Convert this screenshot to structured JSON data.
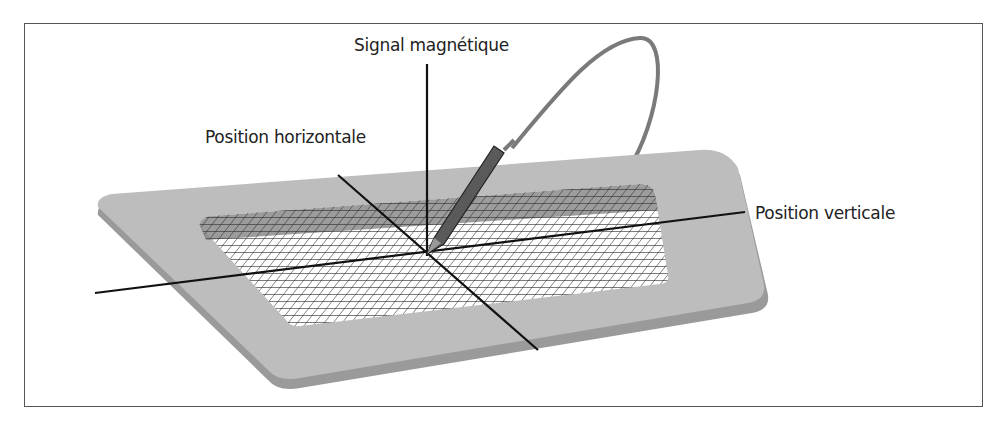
{
  "figure": {
    "type": "diagram",
    "labels": {
      "signal": "Signal magnétique",
      "horizontal": "Position horizontale",
      "vertical": "Position verticale"
    },
    "colors": {
      "frame_border": "#555555",
      "tablet_surface": "#bdbdbd",
      "tablet_edge": "#9a9a9a",
      "grid_line": "#333333",
      "stylus": "#5a5a5a",
      "cable": "#7a7a7a",
      "axis_line": "#111111"
    }
  }
}
